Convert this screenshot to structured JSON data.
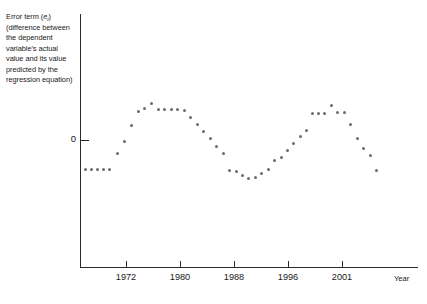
{
  "axes": {
    "y_label_parts": {
      "prefix": "Error term (",
      "symbol": "e",
      "subscript": "i",
      "suffix": ") (difference between the dependent variable's actual value and its value predicted by the regression equation)"
    },
    "y_label_full": "Error term (ei) (difference between the dependent variable's actual value and its value predicted by the regression equation)",
    "y_tick_label": "0",
    "x_axis_title": "Year"
  },
  "chart_data": {
    "type": "scatter",
    "title": "",
    "subtitle": "",
    "xlabel": "Year",
    "ylabel": "Error term (ei) (difference between the dependent variable's actual value and its value predicted by the regression equation)",
    "grid": false,
    "legend": null,
    "annotations": [],
    "xlim": [
      1966,
      2004
    ],
    "ylim": [
      -1.35,
      1.35
    ],
    "xticks": [
      1972,
      1980,
      1988,
      1996,
      2001
    ],
    "xtick_labels": [
      "1972",
      "1980",
      "1988",
      "1996",
      "2001"
    ],
    "yticks": [
      0
    ],
    "ytick_labels": [
      "0"
    ],
    "marker_color": "#6b6b6b",
    "axis_color": "#2b2b2b",
    "background_color": "#ffffff",
    "point_count": 50,
    "pattern": "cyclical serial correlation (positive autocorrelation), two complete waves",
    "x": [
      1966.6,
      1967.5,
      1968.4,
      1969.3,
      1970.2,
      1971.1,
      1972.0,
      1972.9,
      1973.8,
      1974.7,
      1975.6,
      1976.5,
      1977.4,
      1978.3,
      1979.2,
      1980.1,
      1981.0,
      1981.9,
      1982.8,
      1983.7,
      1984.6,
      1985.5,
      1986.4,
      1987.3,
      1988.2,
      1989.1,
      1990.0,
      1990.9,
      1991.8,
      1992.7,
      1993.6,
      1994.5,
      1995.4,
      1996.3,
      1997.2,
      1998.1,
      1999.0,
      1999.9,
      2000.8,
      2001.7
    ],
    "y": [
      -0.3,
      -0.3,
      -0.3,
      -0.3,
      -0.3,
      0.08,
      0.38,
      0.56,
      0.64,
      0.63,
      0.78,
      0.62,
      0.62,
      0.62,
      0.62,
      0.57,
      0.38,
      0.23,
      0.1,
      -0.02,
      -0.17,
      -0.3,
      -0.32,
      -0.42,
      -0.42,
      -0.38,
      -0.32,
      -0.16,
      -0.06,
      0.08,
      0.22,
      0.33,
      0.45,
      0.57,
      0.57,
      0.57,
      0.7,
      0.55,
      0.55,
      0.33
    ],
    "points_px": [
      [
        84,
        168
      ],
      [
        90,
        168
      ],
      [
        96,
        168
      ],
      [
        102,
        168
      ],
      [
        108,
        168
      ],
      [
        116,
        152
      ],
      [
        123,
        140
      ],
      [
        130,
        124
      ],
      [
        137,
        110
      ],
      [
        143,
        108
      ],
      [
        150,
        103
      ],
      [
        157,
        109
      ],
      [
        163,
        109
      ],
      [
        170,
        109
      ],
      [
        176,
        109
      ],
      [
        183,
        110
      ],
      [
        189,
        117
      ],
      [
        196,
        124
      ],
      [
        202,
        130
      ],
      [
        209,
        137
      ],
      [
        215,
        145
      ],
      [
        222,
        152
      ],
      [
        228,
        170
      ],
      [
        235,
        171
      ],
      [
        241,
        174
      ],
      [
        247,
        177
      ],
      [
        254,
        176
      ],
      [
        260,
        172
      ],
      [
        267,
        169
      ],
      [
        273,
        160
      ],
      [
        280,
        157
      ],
      [
        286,
        150
      ],
      [
        292,
        143
      ],
      [
        299,
        136
      ],
      [
        305,
        130
      ],
      [
        311,
        113
      ],
      [
        317,
        113
      ],
      [
        323,
        113
      ],
      [
        330,
        105
      ],
      [
        336,
        112
      ],
      [
        343,
        112
      ],
      [
        349,
        124
      ],
      [
        356,
        138
      ],
      [
        362,
        148
      ],
      [
        369,
        155
      ],
      [
        375,
        170
      ]
    ]
  },
  "dots_px": [
    [
      84,
      168
    ],
    [
      90,
      168
    ],
    [
      96,
      168
    ],
    [
      102,
      168
    ],
    [
      108,
      168
    ],
    [
      116,
      152
    ],
    [
      123,
      140
    ],
    [
      130,
      124
    ],
    [
      137,
      110
    ],
    [
      143,
      107
    ],
    [
      150,
      102
    ],
    [
      157,
      108
    ],
    [
      163,
      108
    ],
    [
      170,
      108
    ],
    [
      176,
      108
    ],
    [
      183,
      109
    ],
    [
      189,
      116
    ],
    [
      196,
      123
    ],
    [
      202,
      130
    ],
    [
      209,
      137
    ],
    [
      215,
      145
    ],
    [
      222,
      152
    ],
    [
      228,
      169
    ],
    [
      235,
      170
    ],
    [
      241,
      174
    ],
    [
      247,
      177
    ],
    [
      254,
      176
    ],
    [
      260,
      172
    ],
    [
      267,
      168
    ],
    [
      273,
      159
    ],
    [
      280,
      156
    ],
    [
      286,
      149
    ],
    [
      292,
      142
    ],
    [
      299,
      135
    ],
    [
      305,
      129
    ],
    [
      311,
      112
    ],
    [
      317,
      112
    ],
    [
      323,
      112
    ],
    [
      330,
      104
    ],
    [
      336,
      111
    ],
    [
      343,
      111
    ],
    [
      349,
      123
    ],
    [
      356,
      137
    ],
    [
      362,
      147
    ],
    [
      369,
      154
    ],
    [
      375,
      169
    ]
  ],
  "xticks_px": [
    {
      "x": 126,
      "label": "1972"
    },
    {
      "x": 180,
      "label": "1980"
    },
    {
      "x": 234,
      "label": "1988"
    },
    {
      "x": 288,
      "label": "1996"
    },
    {
      "x": 342,
      "label": "2001"
    }
  ]
}
